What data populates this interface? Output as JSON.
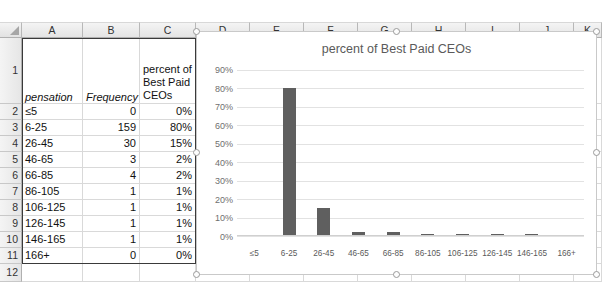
{
  "spreadsheet": {
    "column_headers": [
      "A",
      "B",
      "C",
      "D",
      "E",
      "F",
      "G",
      "H",
      "I",
      "J",
      "K"
    ],
    "row_headers": [
      "1",
      "2",
      "3",
      "4",
      "5",
      "6",
      "7",
      "8",
      "9",
      "10",
      "11",
      "12"
    ],
    "header_row": {
      "a": "pensation",
      "b": "Frequency",
      "c": "percent of Best Paid CEOs"
    },
    "rows": [
      {
        "row": "2",
        "a": "≤5",
        "b": "0",
        "c": "0%"
      },
      {
        "row": "3",
        "a": "6-25",
        "b": "159",
        "c": "80%"
      },
      {
        "row": "4",
        "a": "26-45",
        "b": "30",
        "c": "15%"
      },
      {
        "row": "5",
        "a": "46-65",
        "b": "3",
        "c": "2%"
      },
      {
        "row": "6",
        "a": "66-85",
        "b": "4",
        "c": "2%"
      },
      {
        "row": "7",
        "a": "86-105",
        "b": "1",
        "c": "1%"
      },
      {
        "row": "8",
        "a": "106-125",
        "b": "1",
        "c": "1%"
      },
      {
        "row": "9",
        "a": "126-145",
        "b": "1",
        "c": "1%"
      },
      {
        "row": "10",
        "a": "146-165",
        "b": "1",
        "c": "1%"
      },
      {
        "row": "11",
        "a": "166+",
        "b": "0",
        "c": "0%"
      }
    ]
  },
  "chart_data": {
    "type": "bar",
    "title": "percent of Best Paid CEOs",
    "xlabel": "",
    "ylabel": "",
    "grid": true,
    "legend": "none",
    "ylim": [
      0,
      90
    ],
    "yticks": [
      "0%",
      "10%",
      "20%",
      "30%",
      "40%",
      "50%",
      "60%",
      "70%",
      "80%",
      "90%"
    ],
    "categories": [
      "≤5",
      "6-25",
      "26-45",
      "46-65",
      "66-85",
      "86-105",
      "106-125",
      "126-145",
      "146-165",
      "166+"
    ],
    "values": [
      0,
      80,
      15,
      2,
      2,
      1,
      1,
      1,
      1,
      0
    ],
    "bar_color": "#5f5f5f"
  }
}
